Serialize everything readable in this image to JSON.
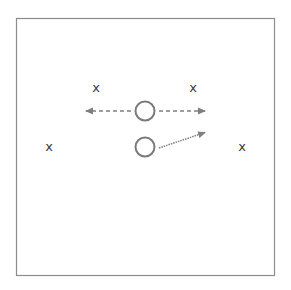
{
  "diagram": {
    "frame": {
      "x": 16,
      "y": 18,
      "width": 259,
      "height": 258,
      "stroke": "#8c8c8c"
    },
    "colors": {
      "marker": "#3a3a3a",
      "circle_stroke": "#7a7a7a",
      "arrow": "#7f7f7f"
    },
    "markers": [
      {
        "id": "x-top-left",
        "label": "x",
        "x": 96,
        "y": 87
      },
      {
        "id": "x-top-right",
        "label": "x",
        "x": 193,
        "y": 87
      },
      {
        "id": "x-mid-left",
        "label": "x",
        "x": 49,
        "y": 146
      },
      {
        "id": "x-mid-right",
        "label": "x",
        "x": 242,
        "y": 146
      }
    ],
    "circles": [
      {
        "id": "circle-top",
        "cx": 145,
        "cy": 111,
        "r": 9.5
      },
      {
        "id": "circle-bottom",
        "cx": 145,
        "cy": 147,
        "r": 9.5
      }
    ],
    "arrows": [
      {
        "id": "arrow-left",
        "style": "dashed",
        "x1": 131,
        "y1": 111,
        "x2": 85,
        "y2": 111
      },
      {
        "id": "arrow-right",
        "style": "dashed",
        "x1": 159,
        "y1": 111,
        "x2": 206,
        "y2": 111
      },
      {
        "id": "arrow-diagonal",
        "style": "dotted",
        "x1": 159,
        "y1": 148,
        "x2": 206,
        "y2": 132
      }
    ]
  }
}
